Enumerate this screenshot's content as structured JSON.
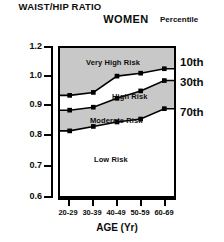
{
  "header": {
    "y_axis_title": "WAIST/HIP RATIO",
    "chart_title": "WOMEN",
    "legend_title": "Percentile"
  },
  "axes": {
    "x_title": "AGE (Yr)",
    "x_ticks": [
      "20-29",
      "30-39",
      "40-49",
      "50-59",
      "60-69"
    ],
    "y_ticks": [
      "1.2",
      "1.0",
      "0.9",
      "0.8",
      "0.7",
      "0.6"
    ]
  },
  "legend": {
    "items": [
      {
        "label": "10th"
      },
      {
        "label": "30th"
      },
      {
        "label": "70th"
      }
    ]
  },
  "zones": [
    {
      "label": "Very High Risk"
    },
    {
      "label": "High Risk"
    },
    {
      "label": "Moderate Risk"
    },
    {
      "label": "Low Risk"
    }
  ],
  "colors": {
    "shaded_band": "#c8c8c8",
    "unshaded_band": "#ffffff",
    "line": "#000000",
    "marker": "#000000",
    "axis": "#000000",
    "text": "#0d0d0d"
  },
  "chart_data": {
    "type": "line",
    "title": "WOMEN",
    "xlabel": "AGE (Yr)",
    "ylabel": "WAIST/HIP RATIO",
    "categories": [
      "20-29",
      "30-39",
      "40-49",
      "50-59",
      "60-69"
    ],
    "x_tick_labels": [
      "20-29",
      "30-39",
      "40-49",
      "50-59",
      "60-69"
    ],
    "y_tick_labels": [
      "1.2",
      "1.0",
      "0.9",
      "0.8",
      "0.7",
      "0.6"
    ],
    "ylim": [
      0.6,
      1.2
    ],
    "grid": false,
    "legend_position": "right",
    "legend_title": "Percentile",
    "series": [
      {
        "name": "10th",
        "values": [
          0.94,
          0.95,
          1.01,
          1.03,
          1.06
        ]
      },
      {
        "name": "30th",
        "values": [
          0.89,
          0.9,
          0.93,
          0.955,
          0.99
        ]
      },
      {
        "name": "70th",
        "values": [
          0.82,
          0.835,
          0.85,
          0.86,
          0.895
        ]
      }
    ],
    "annotations": [
      {
        "text": "Very High Risk",
        "region": "above 10th percentile curve"
      },
      {
        "text": "High Risk",
        "region": "between 10th and 30th percentile curves"
      },
      {
        "text": "Moderate Risk",
        "region": "between 30th and 70th percentile curves"
      },
      {
        "text": "Low Risk",
        "region": "below 70th percentile curve"
      }
    ]
  }
}
